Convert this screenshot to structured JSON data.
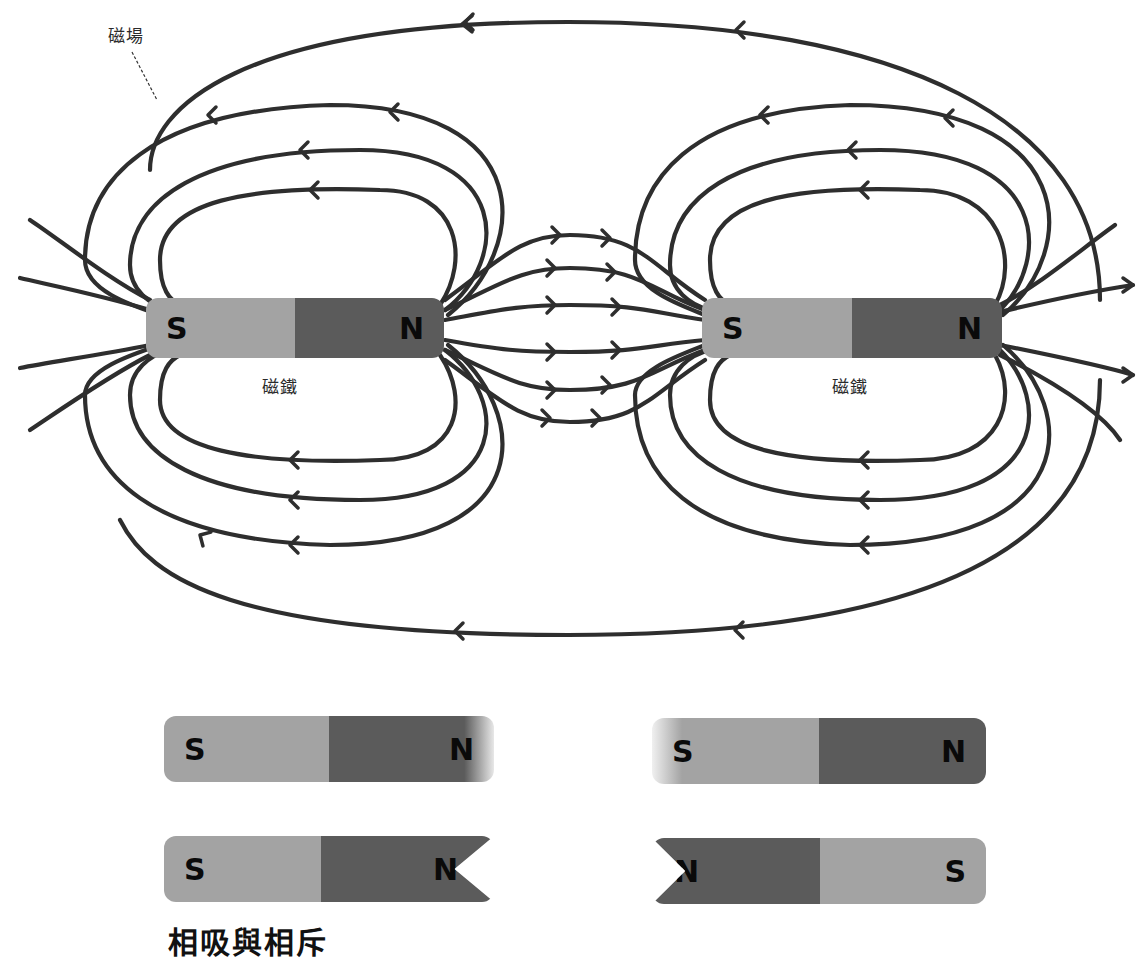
{
  "diagram": {
    "field_label": "磁場",
    "magnet_label": "磁鐵",
    "top_magnets": [
      {
        "left_pole": "S",
        "right_pole": "N",
        "caption": "磁鐵"
      },
      {
        "left_pole": "S",
        "right_pole": "N",
        "caption": "磁鐵"
      }
    ],
    "bottom_magnets": [
      {
        "left_pole": "S",
        "right_pole": "N",
        "variant": "N end faded"
      },
      {
        "left_pole": "S",
        "right_pole": "N",
        "variant": "S end faded"
      },
      {
        "left_pole": "S",
        "right_pole": "N",
        "variant": "N end notched"
      },
      {
        "left_pole": "N",
        "right_pole": "S",
        "variant": "N end notched"
      }
    ],
    "bottom_heading_partial": "相吸與相斥",
    "colors": {
      "south_pole": "#a3a3a3",
      "north_pole": "#5b5b5b",
      "field_line": "#2e2e2e",
      "background": "#ffffff"
    }
  }
}
